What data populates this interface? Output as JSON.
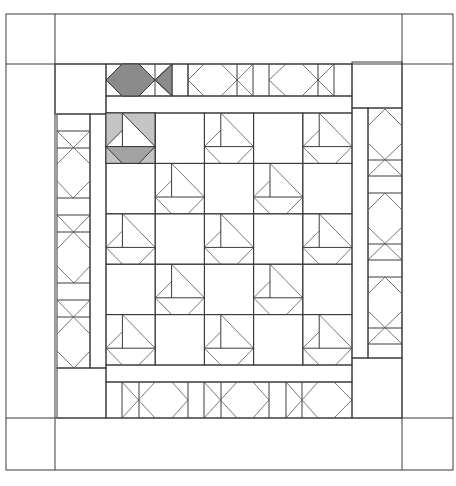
{
  "diagram": {
    "type": "quilt-layout",
    "colors": {
      "line": "#3a3a3a",
      "background": "#ffffff",
      "shade_dark": "#8a8a8a",
      "shade_mid": "#a3a3a3",
      "shade_light": "#c4c4c4"
    },
    "outer_border": {
      "x": 6,
      "y": 14,
      "width": 447,
      "height": 456,
      "corner_size": 49
    },
    "center_grid": {
      "x": 106,
      "y": 113,
      "cols": 5,
      "rows": 5,
      "cell_w": 49.2,
      "cell_h": 50.4,
      "pattern": [
        [
          "boat",
          "plain",
          "boat",
          "plain",
          "boat"
        ],
        [
          "plain",
          "boat",
          "plain",
          "boat",
          "plain"
        ],
        [
          "boat",
          "plain",
          "boat",
          "plain",
          "boat"
        ],
        [
          "plain",
          "boat",
          "plain",
          "boat",
          "plain"
        ],
        [
          "boat",
          "plain",
          "boat",
          "plain",
          "boat"
        ]
      ],
      "shaded_cell": {
        "row": 0,
        "col": 0
      }
    },
    "strips": {
      "top": {
        "units": [
          "fish-shaded",
          "diamond-x",
          "diamond-x"
        ]
      },
      "bottom": {
        "units": [
          "x-diamond",
          "x-diamond",
          "x-diamond"
        ]
      },
      "left": {
        "units": [
          "x-diamond",
          "x-diamond",
          "x-diamond"
        ]
      },
      "right": {
        "units": [
          "diamond-x",
          "diamond-x",
          "diamond-x"
        ]
      }
    }
  }
}
